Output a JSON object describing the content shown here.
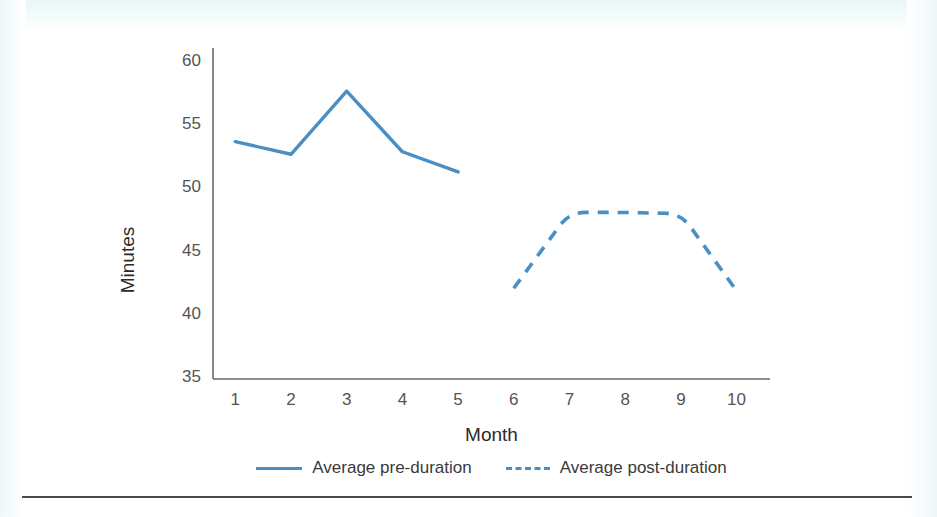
{
  "chart_data": {
    "type": "line",
    "title": "",
    "xlabel": "Month",
    "ylabel": "Minutes",
    "x": [
      1,
      2,
      3,
      4,
      5,
      6,
      7,
      8,
      9,
      10
    ],
    "categories": [
      "1",
      "2",
      "3",
      "4",
      "5",
      "6",
      "7",
      "8",
      "9",
      "10"
    ],
    "xlim": [
      0.6,
      10.6
    ],
    "ylim": [
      35,
      60
    ],
    "yticks": [
      35,
      40,
      45,
      50,
      55,
      60
    ],
    "ytick_labels": [
      "35",
      "40",
      "45",
      "50",
      "55",
      "60"
    ],
    "xticks": [
      1,
      2,
      3,
      4,
      5,
      6,
      7,
      8,
      9,
      10
    ],
    "xtick_labels": [
      "1",
      "2",
      "3",
      "4",
      "5",
      "6",
      "7",
      "8",
      "9",
      "10"
    ],
    "grid": false,
    "legend_position": "bottom",
    "series": [
      {
        "name": "Average pre-duration",
        "style": "solid",
        "color": "#4a8fc4",
        "x": [
          1,
          2,
          3,
          4,
          5
        ],
        "values": [
          53.7,
          52.7,
          57.7,
          52.9,
          51.3
        ]
      },
      {
        "name": "Average post-duration",
        "style": "dashed",
        "color": "#4a8fc4",
        "x": [
          6,
          7,
          8,
          9,
          10
        ],
        "values": [
          42.1,
          48.1,
          48.1,
          48.0,
          41.9
        ]
      }
    ]
  },
  "axes": {
    "y_title": "Minutes",
    "x_title": "Month",
    "axis_color": "#6a6a6a"
  },
  "legend": {
    "items": [
      {
        "label": "Average pre-duration",
        "style": "solid",
        "color": "#4a8fc4"
      },
      {
        "label": "Average post-duration",
        "style": "dashed",
        "color": "#4a8fc4"
      }
    ]
  },
  "colors": {
    "series": "#4a8fc4",
    "axis": "#6a6a6a",
    "tick_text": "#545454",
    "title_text": "#2b2b2b",
    "rule": "#4a4a4a",
    "background": "#ffffff"
  }
}
